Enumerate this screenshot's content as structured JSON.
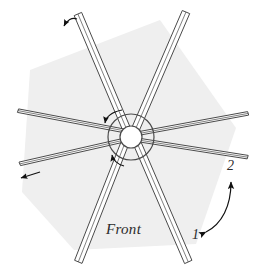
{
  "figure": {
    "type": "technical-line-diagram",
    "background_color": "#ffffff",
    "shading_color": "#efefef",
    "line_color": "#4a4a4a",
    "arrow_color": "#111111",
    "text_color": "#2b2b2b"
  },
  "labels": {
    "front": "Front",
    "angle_one": "1",
    "angle_two": "2"
  },
  "hexagon": {
    "name": "shaded-hexagon-region",
    "fill": "#efefef",
    "vertices": [
      [
        160,
        20
      ],
      [
        236,
        128
      ],
      [
        196,
        244
      ],
      [
        74,
        250
      ],
      [
        22,
        192
      ],
      [
        30,
        70
      ]
    ]
  },
  "hub": {
    "name": "center-hub",
    "center": [
      131,
      137
    ],
    "outer_radius": 23,
    "inner_radius": 11,
    "fill": "#ffffff",
    "stroke": "#4a4a4a"
  },
  "spokes": [
    {
      "name": "spoke-upper-left",
      "angle_deg": 251,
      "tip": [
        78,
        14
      ],
      "width": 7
    },
    {
      "name": "spoke-upper-right",
      "angle_deg": 289,
      "tip": [
        186,
        12
      ],
      "width": 7
    },
    {
      "name": "spoke-left-upper",
      "angle_deg": 188,
      "tip": [
        18,
        116
      ],
      "width": 7
    },
    {
      "name": "spoke-left-lower",
      "angle_deg": 170,
      "tip": [
        20,
        168
      ],
      "width": 7
    },
    {
      "name": "spoke-right-upper",
      "angle_deg": 350,
      "tip": [
        248,
        115
      ],
      "width": 7
    },
    {
      "name": "spoke-right-lower",
      "angle_deg": 10,
      "tip": [
        248,
        158
      ],
      "width": 7
    },
    {
      "name": "spoke-lower-left",
      "angle_deg": 108,
      "tip": [
        78,
        262
      ],
      "width": 7
    },
    {
      "name": "spoke-lower-right",
      "angle_deg": 72,
      "tip": [
        188,
        262
      ],
      "width": 7
    }
  ],
  "annotations": [
    {
      "name": "arrow-spoke-tip-upper-left",
      "kind": "curved-arrow-single",
      "direction": "up-left",
      "tip": [
        66,
        29
      ]
    },
    {
      "name": "arrow-spoke-tip-left",
      "kind": "straight-arrow-single",
      "direction": "left",
      "tip": [
        19,
        178
      ]
    },
    {
      "name": "arrow-hub-upper",
      "kind": "curved-arrow-single",
      "direction": "down-left",
      "tip": [
        106,
        124
      ]
    },
    {
      "name": "arrow-hub-lower",
      "kind": "curved-arrow-single",
      "direction": "down-left",
      "tip": [
        113,
        155
      ]
    },
    {
      "name": "arrow-angle-sweep",
      "kind": "curved-arrow-double",
      "from_label": "1",
      "to_label": "2",
      "from_point": [
        205,
        232
      ],
      "to_point": [
        230,
        180
      ]
    }
  ]
}
